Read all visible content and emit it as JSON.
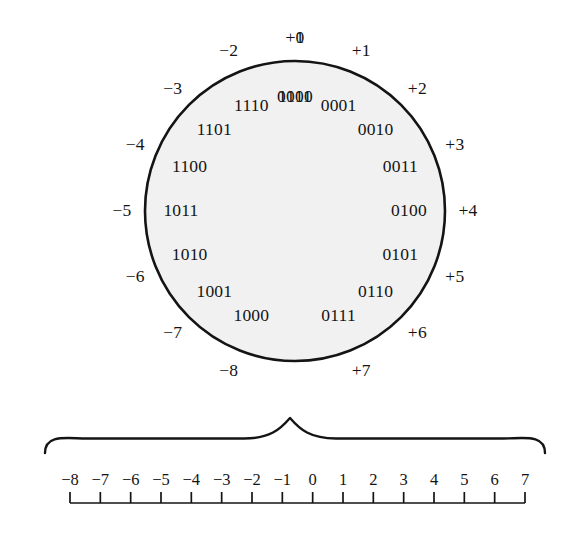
{
  "figure": {
    "colors": {
      "stroke": "#141414",
      "circle_fill": "#f1f1f1",
      "text": "#141414",
      "background": "#ffffff"
    },
    "circle": {
      "center_x": 295,
      "center_y": 211,
      "radius": 150,
      "stroke_width": 2.6,
      "binary_label_radius": 114,
      "decimal_label_radius": 173,
      "positions": [
        {
          "binary": "0000",
          "decimal": "+0",
          "angle_deg": -90
        },
        {
          "binary": "0001",
          "decimal": "+1",
          "angle_deg": -67.5
        },
        {
          "binary": "0010",
          "decimal": "+2",
          "angle_deg": -45
        },
        {
          "binary": "0011",
          "decimal": "+3",
          "angle_deg": -22.5
        },
        {
          "binary": "0100",
          "decimal": "+4",
          "angle_deg": 0
        },
        {
          "binary": "0101",
          "decimal": "+5",
          "angle_deg": 22.5
        },
        {
          "binary": "0110",
          "decimal": "+6",
          "angle_deg": 45
        },
        {
          "binary": "0111",
          "decimal": "+7",
          "angle_deg": 67.5
        },
        {
          "binary": "1000",
          "decimal": "−8",
          "angle_deg": 112.5
        },
        {
          "binary": "1001",
          "decimal": "−7",
          "angle_deg": 135
        },
        {
          "binary": "1010",
          "decimal": "−6",
          "angle_deg": 157.5
        },
        {
          "binary": "1011",
          "decimal": "−5",
          "angle_deg": 180
        },
        {
          "binary": "1100",
          "decimal": "−4",
          "angle_deg": 202.5
        },
        {
          "binary": "1101",
          "decimal": "−3",
          "angle_deg": 225
        },
        {
          "binary": "1110",
          "decimal": "−2",
          "angle_deg": 247.5
        },
        {
          "binary": "1111",
          "decimal": "−1",
          "angle_deg": 270
        }
      ]
    },
    "brace": {
      "left_x": 45,
      "right_x": 545,
      "peak_x": 290,
      "top_y": 418,
      "base_y": 453,
      "stroke_width": 2.4
    },
    "number_line": {
      "axis_y": 503,
      "left_x": 70,
      "right_x": 525,
      "tick_height": 11,
      "stroke_width": 1.7,
      "label_y": 480,
      "ticks": [
        "−8",
        "−7",
        "−6",
        "−5",
        "−4",
        "−3",
        "−2",
        "−1",
        "0",
        "1",
        "2",
        "3",
        "4",
        "5",
        "6",
        "7"
      ]
    }
  },
  "chart_data": {
    "type": "diagram",
    "subtype": "number-circle-with-number-line",
    "bit_width": 4,
    "wheel": {
      "description": "Sixteen 4-bit patterns arranged clockwise around a circle starting at 0000 at the top, paired with their signed two's complement values.",
      "binary_codes": [
        "0000",
        "0001",
        "0010",
        "0011",
        "0100",
        "0101",
        "0110",
        "0111",
        "1000",
        "1001",
        "1010",
        "1011",
        "1100",
        "1101",
        "1110",
        "1111"
      ],
      "signed_values": [
        "+0",
        "+1",
        "+2",
        "+3",
        "+4",
        "+5",
        "+6",
        "+7",
        "−8",
        "−7",
        "−6",
        "−5",
        "−4",
        "−3",
        "−2",
        "−1"
      ],
      "signed_values_numeric": [
        0,
        1,
        2,
        3,
        4,
        5,
        6,
        7,
        -8,
        -7,
        -6,
        -5,
        -4,
        -3,
        -2,
        -1
      ]
    },
    "axis": {
      "label": "",
      "tick_labels": [
        "−8",
        "−7",
        "−6",
        "−5",
        "−4",
        "−3",
        "−2",
        "−1",
        "0",
        "1",
        "2",
        "3",
        "4",
        "5",
        "6",
        "7"
      ],
      "tick_values": [
        -8,
        -7,
        -6,
        -5,
        -4,
        -3,
        -2,
        -1,
        0,
        1,
        2,
        3,
        4,
        5,
        6,
        7
      ],
      "xlim": [
        -8,
        7
      ],
      "grid": false
    },
    "legend": []
  }
}
